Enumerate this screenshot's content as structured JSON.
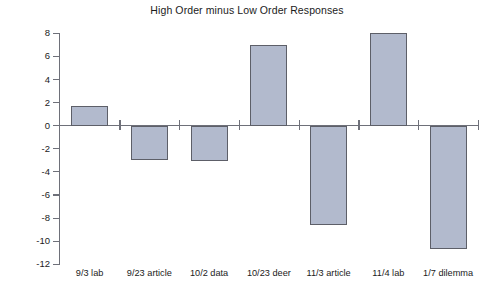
{
  "chart_data": {
    "type": "bar",
    "title": "High Order minus Low Order Responses",
    "xlabel": "",
    "ylabel": "Difference",
    "categories": [
      "9/3 lab",
      "9/23 article",
      "10/2 data",
      "10/23 deer",
      "11/3 article",
      "11/4 lab",
      "1/7 dilemma"
    ],
    "values": [
      1.7,
      -3.0,
      -3.1,
      7.0,
      -8.6,
      8.0,
      -10.7
    ],
    "ylim": [
      -12,
      8
    ],
    "yticks": [
      8,
      6,
      4,
      2,
      0,
      -2,
      -4,
      -6,
      -8,
      -10,
      -12
    ],
    "ytick_labels": [
      "8",
      "6",
      "4",
      "2",
      "0",
      "-2",
      "-4",
      "-6",
      "-8",
      "-10",
      "-12"
    ],
    "grid": false,
    "legend": null,
    "bar_color": "#b2bacd",
    "bar_edge_color": "#5d5f68",
    "axis_color": "#6e7079",
    "background": "#ffffff"
  }
}
